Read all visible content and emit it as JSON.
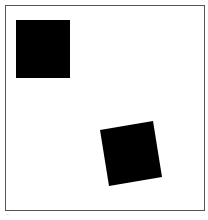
{
  "figure": {
    "frame": {
      "x": 5,
      "y": 5,
      "width": 199,
      "height": 205,
      "stroke": "#555555"
    },
    "shapes": [
      {
        "name": "square-upright",
        "points": "16,20 70,20 70,78 16,78",
        "fill": "#000000"
      },
      {
        "name": "square-rotated",
        "points": "100,130 153,121 162,177 109,186",
        "fill": "#000000"
      }
    ],
    "caption": "··"
  }
}
